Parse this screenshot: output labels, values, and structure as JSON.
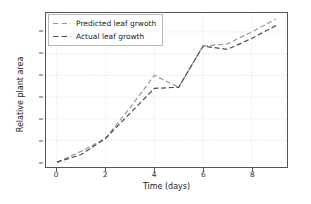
{
  "chart_data": {
    "type": "line",
    "title": "",
    "xlabel": "Time (days)",
    "ylabel": "Relative plant area",
    "x": [
      0,
      1,
      2,
      3,
      4,
      5,
      6,
      7,
      8,
      9
    ],
    "xlim": [
      -0.45,
      9.45
    ],
    "ylim": [
      0.955,
      2.375
    ],
    "xticks": [
      "0",
      "2",
      "4",
      "6",
      "8"
    ],
    "xtick_values": [
      0,
      2,
      4,
      6,
      8
    ],
    "yticks": [
      "1.0",
      "1.2",
      "1.4",
      "1.6",
      "1.8",
      "2.0",
      "2.2"
    ],
    "ytick_values": [
      1.0,
      1.2,
      1.4,
      1.6,
      1.8,
      2.0,
      2.2
    ],
    "grid": true,
    "grid_style": "dotted",
    "grid_color": "#d0d0d0",
    "legend_position": "upper left",
    "series": [
      {
        "name": "Predicted leaf grwoth",
        "color": "#9a9a9a",
        "linestyle": "dashed",
        "values": [
          1.0,
          1.1,
          1.22,
          1.5,
          1.8,
          1.69,
          2.07,
          2.09,
          2.2,
          2.32
        ]
      },
      {
        "name": "Actual leaf growth",
        "color": "#4d4d4d",
        "linestyle": "dashed",
        "values": [
          1.0,
          1.07,
          1.22,
          1.45,
          1.68,
          1.69,
          2.07,
          2.04,
          2.14,
          2.26
        ]
      }
    ]
  },
  "legend": {
    "entries": [
      {
        "label": "Predicted leaf grwoth"
      },
      {
        "label": "Actual leaf growth"
      }
    ]
  }
}
